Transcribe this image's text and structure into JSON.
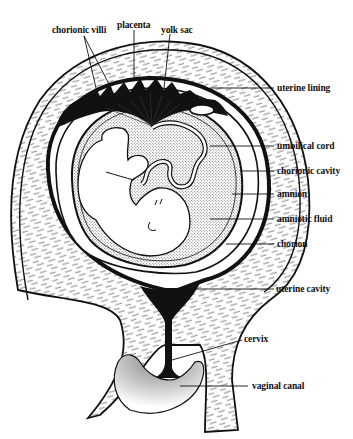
{
  "diagram": {
    "title": "",
    "labels": {
      "chorionic_villi": "chorionic villi",
      "placenta": "placenta",
      "yolk_sac": "yolk sac",
      "uterine_lining": "uterine lining",
      "umbilical_cord": "umbilical cord",
      "chorionic_cavity": "chorionic cavity",
      "amnion": "amnion",
      "amniotic_fluid": "amniotic fluid",
      "chorion": "chorion",
      "uterine_cavity": "uterine cavity",
      "cervix": "cervix",
      "vaginal_canal": "vaginal canal"
    },
    "colors": {
      "ink": "#111111",
      "background": "#ffffff",
      "fluid_stipple": "#9a9a9a"
    }
  }
}
